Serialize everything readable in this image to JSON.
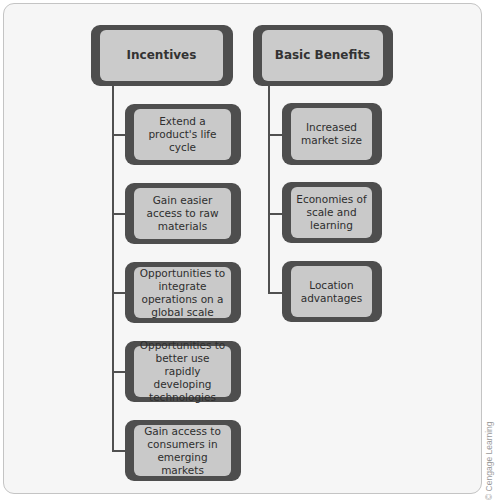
{
  "diagram": {
    "columns": [
      {
        "header": "Incentives",
        "items": [
          "Extend a product's life cycle",
          "Gain easier access to raw materials",
          "Opportunities to integrate operations on a global scale",
          "Opportunities to better use rapidly developing technologies",
          "Gain access to consumers in emerging markets"
        ]
      },
      {
        "header": "Basic Benefits",
        "items": [
          "Increased market size",
          "Economies of scale and learning",
          "Location advantages"
        ]
      }
    ]
  },
  "credit": "© Cengage Learning",
  "colors": {
    "box_border": "#4e4e4e",
    "box_fill": "#c9c9c9",
    "frame_bg": "#f6f6f6",
    "connector": "#505050"
  }
}
